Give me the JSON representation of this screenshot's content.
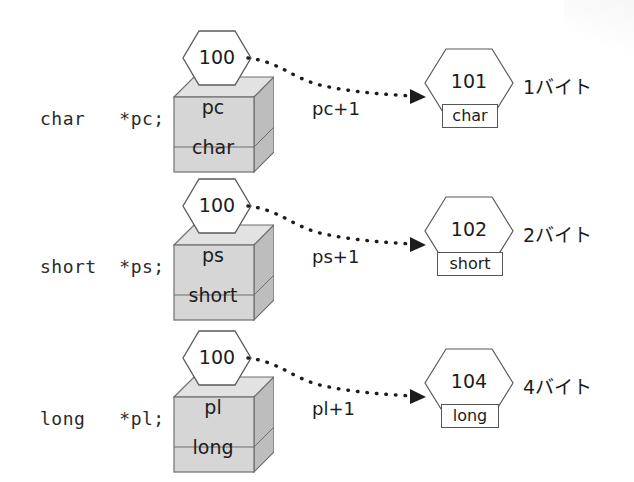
{
  "figure": {
    "background": "#ffffff",
    "ink": "#1c1c1c",
    "cube_face": "#d6d6d6",
    "cube_side": "#bdbdbd",
    "cube_top": "#e2e2e2",
    "cube_stroke": "#6e6e6e"
  },
  "rows": [
    {
      "declaration": "char   *pc;",
      "source_address": "100",
      "pointer_name": "pc",
      "pointer_type": "char",
      "offset_label": "pc+1",
      "target_address": "101",
      "target_type": "char",
      "size_label": "1バイト"
    },
    {
      "declaration": "short  *ps;",
      "source_address": "100",
      "pointer_name": "ps",
      "pointer_type": "short",
      "offset_label": "ps+1",
      "target_address": "102",
      "target_type": "short",
      "size_label": "2バイト"
    },
    {
      "declaration": "long   *pl;",
      "source_address": "100",
      "pointer_name": "pl",
      "pointer_type": "long",
      "offset_label": "pl+1",
      "target_address": "104",
      "target_type": "long",
      "size_label": "4バイト"
    }
  ]
}
